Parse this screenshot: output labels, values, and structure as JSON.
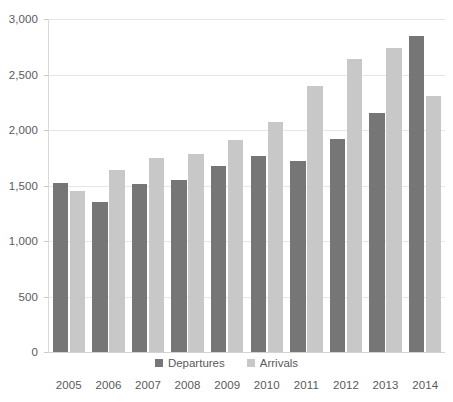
{
  "chart_data": {
    "type": "bar",
    "title": "",
    "subtitle": "",
    "xlabel": "",
    "ylabel": "",
    "categories": [
      "2005",
      "2006",
      "2007",
      "2008",
      "2009",
      "2010",
      "2011",
      "2012",
      "2013",
      "2014"
    ],
    "series": [
      {
        "name": "Departures",
        "color": "#767676",
        "values": [
          1520,
          1350,
          1510,
          1550,
          1680,
          1770,
          1720,
          1920,
          2150,
          2850
        ]
      },
      {
        "name": "Arrivals",
        "color": "#c8c8c8",
        "values": [
          1450,
          1640,
          1750,
          1780,
          1910,
          2070,
          2400,
          2640,
          2740,
          2310
        ]
      }
    ],
    "ylim": [
      0,
      3000
    ],
    "ytick_values": [
      0,
      500,
      1000,
      1500,
      2000,
      2500,
      3000
    ],
    "ytick_labels": [
      "0",
      "500",
      "1,000",
      "1,500",
      "2,000",
      "2,500",
      "3,000"
    ],
    "grid": true,
    "legend_position": "bottom",
    "legend_entries": [
      "Departures",
      "Arrivals"
    ]
  },
  "colors": {
    "departures": "#767676",
    "arrivals": "#c8c8c8",
    "gridline": "#e6e6e6",
    "axis": "#d9d9d9",
    "text": "#5a5a5a",
    "background": "#ffffff"
  }
}
